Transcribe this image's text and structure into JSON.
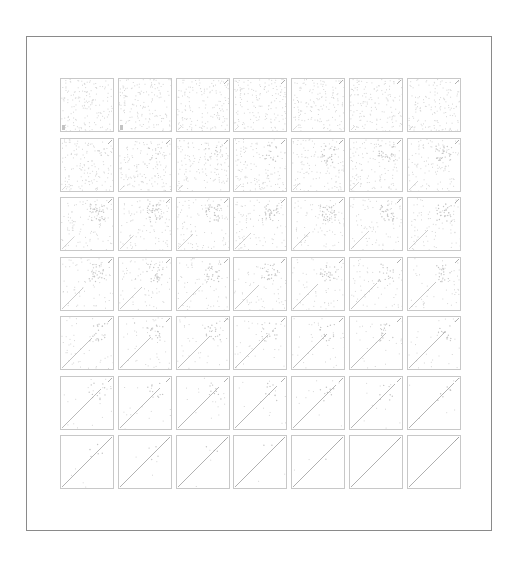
{
  "figure": {
    "rows": 7,
    "cols": 7,
    "cell_size": 54,
    "col_step": 57.8,
    "row_step": 59.5,
    "colors": {
      "frame_border": "#8a8a8a",
      "cell_border": "#c8c8c8",
      "noise": "#d6d6d6",
      "line": "#9a9a9a",
      "blob": "#c4c4c4"
    },
    "cells": [
      {
        "noise": 1.0,
        "line": 0.0,
        "blob": 0.0
      },
      {
        "noise": 0.98,
        "line": 0.0,
        "blob": 0.0
      },
      {
        "noise": 0.96,
        "line": 0.02,
        "blob": 0.0
      },
      {
        "noise": 0.95,
        "line": 0.03,
        "blob": 0.0
      },
      {
        "noise": 0.94,
        "line": 0.04,
        "blob": 0.0
      },
      {
        "noise": 0.93,
        "line": 0.05,
        "blob": 0.0
      },
      {
        "noise": 0.92,
        "line": 0.06,
        "blob": 0.0
      },
      {
        "noise": 0.9,
        "line": 0.08,
        "blob": 0.1
      },
      {
        "noise": 0.88,
        "line": 0.09,
        "blob": 0.15
      },
      {
        "noise": 0.86,
        "line": 0.1,
        "blob": 0.2
      },
      {
        "noise": 0.82,
        "line": 0.12,
        "blob": 0.3
      },
      {
        "noise": 0.78,
        "line": 0.14,
        "blob": 0.4
      },
      {
        "noise": 0.74,
        "line": 0.16,
        "blob": 0.45
      },
      {
        "noise": 0.7,
        "line": 0.18,
        "blob": 0.5
      },
      {
        "noise": 0.62,
        "line": 0.25,
        "blob": 0.6
      },
      {
        "noise": 0.6,
        "line": 0.27,
        "blob": 0.6
      },
      {
        "noise": 0.58,
        "line": 0.3,
        "blob": 0.6
      },
      {
        "noise": 0.55,
        "line": 0.32,
        "blob": 0.55
      },
      {
        "noise": 0.52,
        "line": 0.34,
        "blob": 0.55
      },
      {
        "noise": 0.5,
        "line": 0.36,
        "blob": 0.5
      },
      {
        "noise": 0.48,
        "line": 0.38,
        "blob": 0.5
      },
      {
        "noise": 0.44,
        "line": 0.42,
        "blob": 0.5
      },
      {
        "noise": 0.42,
        "line": 0.44,
        "blob": 0.48
      },
      {
        "noise": 0.4,
        "line": 0.46,
        "blob": 0.46
      },
      {
        "noise": 0.38,
        "line": 0.48,
        "blob": 0.44
      },
      {
        "noise": 0.36,
        "line": 0.5,
        "blob": 0.42
      },
      {
        "noise": 0.34,
        "line": 0.52,
        "blob": 0.4
      },
      {
        "noise": 0.32,
        "line": 0.54,
        "blob": 0.4
      },
      {
        "noise": 0.28,
        "line": 0.6,
        "blob": 0.38
      },
      {
        "noise": 0.26,
        "line": 0.62,
        "blob": 0.36
      },
      {
        "noise": 0.24,
        "line": 0.64,
        "blob": 0.34
      },
      {
        "noise": 0.22,
        "line": 0.66,
        "blob": 0.32
      },
      {
        "noise": 0.2,
        "line": 0.68,
        "blob": 0.3
      },
      {
        "noise": 0.18,
        "line": 0.7,
        "blob": 0.28
      },
      {
        "noise": 0.16,
        "line": 0.72,
        "blob": 0.26
      },
      {
        "noise": 0.12,
        "line": 0.78,
        "blob": 0.24
      },
      {
        "noise": 0.1,
        "line": 0.8,
        "blob": 0.22
      },
      {
        "noise": 0.09,
        "line": 0.82,
        "blob": 0.2
      },
      {
        "noise": 0.08,
        "line": 0.84,
        "blob": 0.18
      },
      {
        "noise": 0.07,
        "line": 0.86,
        "blob": 0.16
      },
      {
        "noise": 0.06,
        "line": 0.88,
        "blob": 0.14
      },
      {
        "noise": 0.05,
        "line": 0.9,
        "blob": 0.12
      },
      {
        "noise": 0.03,
        "line": 0.92,
        "blob": 0.1
      },
      {
        "noise": 0.02,
        "line": 0.94,
        "blob": 0.08
      },
      {
        "noise": 0.02,
        "line": 0.95,
        "blob": 0.06
      },
      {
        "noise": 0.01,
        "line": 0.96,
        "blob": 0.04
      },
      {
        "noise": 0.01,
        "line": 0.97,
        "blob": 0.02
      },
      {
        "noise": 0.0,
        "line": 0.98,
        "blob": 0.0
      },
      {
        "noise": 0.0,
        "line": 1.0,
        "blob": 0.0
      }
    ]
  }
}
